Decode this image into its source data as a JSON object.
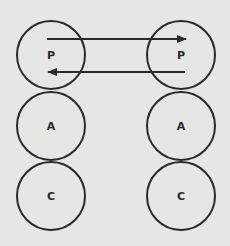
{
  "diagram": {
    "left_column": [
      {
        "label": "P",
        "cx": 51,
        "cy": 55
      },
      {
        "label": "A",
        "cx": 51,
        "cy": 126
      },
      {
        "label": "C",
        "cx": 51,
        "cy": 196
      }
    ],
    "right_column": [
      {
        "label": "P",
        "cx": 181,
        "cy": 55
      },
      {
        "label": "A",
        "cx": 181,
        "cy": 126
      },
      {
        "label": "C",
        "cx": 181,
        "cy": 196
      }
    ],
    "radius": 34,
    "arrows": [
      {
        "direction": "right",
        "from_x": 47,
        "to_x": 186,
        "y": 39
      },
      {
        "direction": "left",
        "from_x": 185,
        "to_x": 48,
        "y": 72
      }
    ],
    "colors": {
      "background": "#e6e6e4",
      "stroke": "#2a2a2a"
    }
  }
}
